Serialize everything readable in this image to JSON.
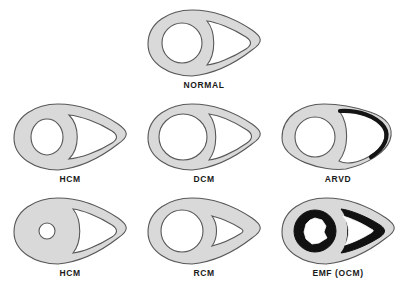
{
  "figure": {
    "background_color": "#ffffff",
    "myocardium_color": "#d9d9d9",
    "outline_color": "#585858",
    "cavity_color": "#ffffff",
    "fibrosis_color": "#111111",
    "label_color": "#1a1a1a",
    "rows": 3,
    "columns": 3,
    "panel_count": 7
  },
  "panels": [
    {
      "id": "normal",
      "label": "NORMAL",
      "row": 1,
      "column": 2,
      "lv_cavity": "normal round",
      "rv_cavity": "normal crescent",
      "wall": "normal thickness",
      "fibrosis": "none"
    },
    {
      "id": "hcm-upper",
      "label": "HCM",
      "row": 2,
      "column": 1,
      "lv_cavity": "small oval",
      "rv_cavity": "normal crescent",
      "wall": "thickened",
      "fibrosis": "none"
    },
    {
      "id": "dcm",
      "label": "DCM",
      "row": 2,
      "column": 2,
      "lv_cavity": "dilated round",
      "rv_cavity": "dilated crescent",
      "wall": "thinned",
      "fibrosis": "none"
    },
    {
      "id": "arvd",
      "label": "ARVD",
      "row": 2,
      "column": 3,
      "lv_cavity": "normal round",
      "rv_cavity": "dilated with thin free wall",
      "wall": "right ventricular free wall thinned and darkened",
      "fibrosis": "right ventricular free wall fatty replacement"
    },
    {
      "id": "hcm-lower",
      "label": "HCM",
      "row": 3,
      "column": 1,
      "lv_cavity": "very small round",
      "rv_cavity": "normal crescent",
      "wall": "markedly thickened",
      "fibrosis": "none"
    },
    {
      "id": "rcm",
      "label": "RCM",
      "row": 3,
      "column": 2,
      "lv_cavity": "normal round",
      "rv_cavity": "reduced small crescent",
      "wall": "normal thickness, stiff",
      "fibrosis": "none"
    },
    {
      "id": "emf-ocm",
      "label": "EMF (OCM)",
      "row": 3,
      "column": 3,
      "lv_cavity": "irregular scalloped, obliterated",
      "rv_cavity": "triangular, obliterated apex",
      "wall": "normal thickness",
      "fibrosis": "thick black endocardial fibrosis lining both ventricles"
    }
  ]
}
